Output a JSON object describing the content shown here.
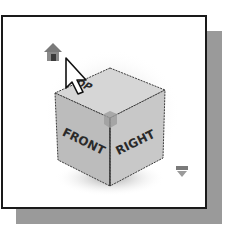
{
  "viewcube": {
    "faces": {
      "top": "TOP",
      "front": "FRONT",
      "right": "RIGHT"
    },
    "icons": {
      "home": "home-icon",
      "cursor": "cursor-arrow-icon",
      "menu": "chevron-down-icon"
    },
    "colors": {
      "frame_border": "#1a1a1a",
      "shadow": "#9a9a9a",
      "cube_top": "#d4d4d4",
      "cube_front": "#bdbdbd",
      "cube_right": "#c6c6c6",
      "edge": "#3a3a3a",
      "background": "#ffffff"
    }
  }
}
